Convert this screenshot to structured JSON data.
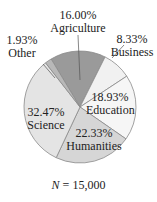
{
  "chart_data": {
    "type": "pie",
    "title": "",
    "note": "N = 15,000",
    "note_var": "N",
    "note_value": "= 15,000",
    "slices": [
      {
        "label": "Agriculture",
        "value": 16.0,
        "pct": "16.00%",
        "color": "#9a9a9a"
      },
      {
        "label": "Business",
        "value": 8.33,
        "pct": "8.33%",
        "color": "#f1f1f1"
      },
      {
        "label": "Education",
        "value": 18.93,
        "pct": "18.93%",
        "color": "#f6f6f6"
      },
      {
        "label": "Humanities",
        "value": 22.33,
        "pct": "22.33%",
        "color": "#d6d6d6"
      },
      {
        "label": "Science",
        "value": 32.47,
        "pct": "32.47%",
        "color": "#e4e4e4"
      },
      {
        "label": "Other",
        "value": 1.93,
        "pct": "1.93%",
        "color": "#b8b8b8"
      }
    ],
    "start_angle_deg": -31,
    "direction": "clockwise"
  }
}
